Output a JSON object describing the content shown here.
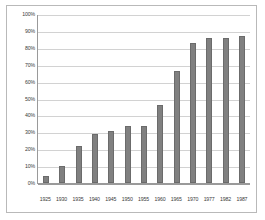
{
  "chart_data": {
    "type": "bar",
    "title": "",
    "subtitle": "",
    "xlabel": "",
    "ylabel": "",
    "categories": [
      "1925",
      "1930",
      "1935",
      "1940",
      "1945",
      "1950",
      "1955",
      "1960",
      "1965",
      "1970",
      "1977",
      "1982",
      "1987"
    ],
    "values": [
      4,
      10,
      22,
      29,
      31,
      34,
      34,
      46,
      66,
      83,
      86,
      86,
      87
    ],
    "value_unit": "%",
    "ylim": [
      0,
      100
    ],
    "ytick_step": 10,
    "ytick_labels": [
      "100%",
      "90%",
      "80%",
      "70%",
      "60%",
      "50%",
      "40%",
      "30%",
      "20%",
      "10%",
      "0%"
    ],
    "ytick_values": [
      100,
      90,
      80,
      70,
      60,
      50,
      40,
      30,
      20,
      10,
      0
    ],
    "grid": true,
    "grid_axis": "y",
    "legend": false,
    "legend_position": "none",
    "annotations": [],
    "series": [
      {
        "name": "",
        "values": [
          4,
          10,
          22,
          29,
          31,
          34,
          34,
          46,
          66,
          83,
          86,
          86,
          87
        ]
      }
    ]
  },
  "style": {
    "bar_color": "#808080",
    "bar_border_color": "#6b6b6b",
    "gridline_color": "#d2d2d2",
    "axis_color": "#9a9a9a",
    "frame_border_color": "#b9b9b9",
    "plot_background": "#ffffff",
    "tick_label_color": "#3a3a3a"
  }
}
